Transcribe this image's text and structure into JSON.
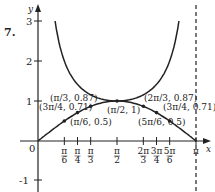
{
  "problem_number": "7.",
  "chart_data": {
    "type": "line",
    "title": "",
    "xlabel": "x",
    "ylabel": "y",
    "xlim": [
      0,
      3.1416
    ],
    "ylim": [
      -1,
      3
    ],
    "yticks": [
      "3",
      "2",
      "1",
      "-1"
    ],
    "origin_label": "0",
    "xticks": [
      "π/6",
      "π/4",
      "π/3",
      "π/2",
      "2π/3",
      "3π/4",
      "5π/6",
      "π"
    ],
    "asymptote": "x = π (dashed)",
    "series": [
      {
        "name": "y = sin x",
        "points": [
          [
            0,
            0
          ],
          [
            0.5236,
            0.5
          ],
          [
            0.7854,
            0.71
          ],
          [
            1.0472,
            0.87
          ],
          [
            1.5708,
            1
          ],
          [
            2.0944,
            0.87
          ],
          [
            2.3562,
            0.71
          ],
          [
            2.618,
            0.5
          ],
          [
            3.1416,
            0
          ]
        ]
      },
      {
        "name": "y = csc x",
        "points": [
          [
            0.3398,
            3
          ],
          [
            1.0472,
            1.15
          ],
          [
            1.5708,
            1
          ],
          [
            2.0944,
            1.15
          ],
          [
            2.8018,
            3
          ]
        ]
      }
    ],
    "annotations": [
      "(π/3, 0.87)",
      "(3π/4, 0.71)",
      "(π/6, 0.5)",
      "(π/2, 1)",
      "(2π/3, 0.87)",
      "(3π/4, 0.71)",
      "(5π/6, 0.5)"
    ]
  }
}
